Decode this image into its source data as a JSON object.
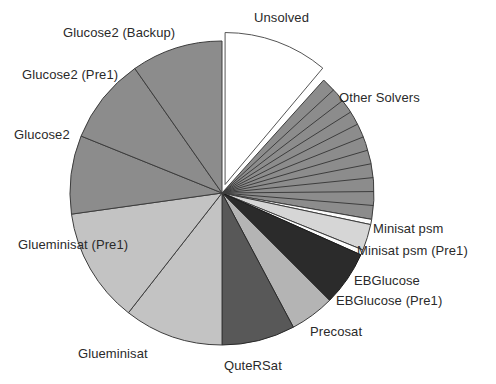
{
  "chart_data": {
    "type": "pie",
    "title": "",
    "subtitle": "",
    "xlabel": "",
    "ylabel": "",
    "legend_position": "none",
    "grid": false,
    "labels_placement": "outside-callout",
    "start_angle_deg": 0,
    "direction": "clockwise",
    "units": "share of instances (degrees of 360)",
    "categories": [
      "Unsolved",
      "Other Solvers",
      "Minisat psm",
      "Minisat psm (Pre1)",
      "EBGlucose",
      "EBGlucose (Pre1)",
      "Precosat",
      "QuteRSat",
      "Glueminisat",
      "Glueminisat (Pre1)",
      "Glucose2",
      "Glucose2 (Pre1)",
      "Glucose2 (Backup)"
    ],
    "values": [
      11.1,
      16.1,
      0.6,
      2.8,
      0.6,
      5.8,
      4.7,
      7.8,
      10.6,
      12.2,
      8.3,
      9.2,
      10.2
    ],
    "angles_deg": [
      40,
      58,
      2,
      10,
      2,
      21,
      17,
      28,
      38,
      44,
      30,
      33,
      37
    ],
    "slices": [
      {
        "label": "Unsolved",
        "start": 0,
        "end": 40,
        "color": "#ffffff",
        "stroke": "#555555",
        "exploded": true,
        "explode_px": 9
      },
      {
        "label": "Other Solvers",
        "start": 42,
        "end": 100,
        "color": "#8c8c8c",
        "stroke": "#3d3d3d",
        "exploded": false,
        "subdivisions": 11
      },
      {
        "label": "Minisat psm",
        "start": 100,
        "end": 102,
        "color": "#fbfbfb",
        "stroke": "#3d3d3d",
        "exploded": false
      },
      {
        "label": "Minisat psm (Pre1)",
        "start": 102,
        "end": 112,
        "color": "#d6d6d6",
        "stroke": "#3d3d3d",
        "exploded": false
      },
      {
        "label": "EBGlucose",
        "start": 112,
        "end": 114,
        "color": "#fbfbfb",
        "stroke": "#3d3d3d",
        "exploded": false
      },
      {
        "label": "EBGlucose (Pre1)",
        "start": 114,
        "end": 135,
        "color": "#2b2b2b",
        "stroke": "#1a1a1a",
        "exploded": false
      },
      {
        "label": "Precosat",
        "start": 135,
        "end": 152,
        "color": "#b4b4b4",
        "stroke": "#3d3d3d",
        "exploded": false
      },
      {
        "label": "QuteRSat",
        "start": 152,
        "end": 180,
        "color": "#585858",
        "stroke": "#2a2a2a",
        "exploded": false
      },
      {
        "label": "Glueminisat",
        "start": 180,
        "end": 218,
        "color": "#c3c3c3",
        "stroke": "#3d3d3d",
        "exploded": false
      },
      {
        "label": "Glueminisat (Pre1)",
        "start": 218,
        "end": 262,
        "color": "#c3c3c3",
        "stroke": "#3d3d3d",
        "exploded": false
      },
      {
        "label": "Glucose2",
        "start": 262,
        "end": 292,
        "color": "#8c8c8c",
        "stroke": "#3d3d3d",
        "exploded": false
      },
      {
        "label": "Glucose2 (Pre1)",
        "start": 292,
        "end": 325,
        "color": "#8c8c8c",
        "stroke": "#3d3d3d",
        "exploded": false
      },
      {
        "label": "Glucose2 (Backup)",
        "start": 325,
        "end": 360,
        "color": "#8c8c8c",
        "stroke": "#3d3d3d",
        "exploded": false
      }
    ]
  },
  "geometry": {
    "cx": 222,
    "cy": 193,
    "r": 152
  },
  "labels": [
    {
      "key": "unsolved",
      "text": "Unsolved",
      "x": 254,
      "y": 11,
      "align": "left"
    },
    {
      "key": "other_solvers",
      "text": "Other Solvers",
      "x": 339,
      "y": 91,
      "align": "left"
    },
    {
      "key": "minisat_psm",
      "text": "Minisat psm",
      "x": 373,
      "y": 222,
      "align": "left"
    },
    {
      "key": "minisat_psm_pre1",
      "text": "Minisat psm (Pre1)",
      "x": 357,
      "y": 244,
      "align": "left"
    },
    {
      "key": "ebglucose",
      "text": "EBGlucose",
      "x": 354,
      "y": 274,
      "align": "left"
    },
    {
      "key": "ebglucose_pre1",
      "text": "EBGlucose (Pre1)",
      "x": 336,
      "y": 294,
      "align": "left"
    },
    {
      "key": "precosat",
      "text": "Precosat",
      "x": 310,
      "y": 325,
      "align": "left"
    },
    {
      "key": "quters at",
      "text": "QuteRSat",
      "x": 224,
      "y": 359,
      "align": "left"
    },
    {
      "key": "glueminisat",
      "text": "Glueminisat",
      "x": 78,
      "y": 347,
      "align": "left"
    },
    {
      "key": "glueminisat_pre1",
      "text": "Glueminisat (Pre1)",
      "x": 18,
      "y": 238,
      "align": "left"
    },
    {
      "key": "glucose2",
      "text": "Glucose2",
      "x": 14,
      "y": 128,
      "align": "left"
    },
    {
      "key": "glucose2_pre1",
      "text": "Glucose2 (Pre1)",
      "x": 22,
      "y": 68,
      "align": "left"
    },
    {
      "key": "glucose2_backup",
      "text": "Glucose2 (Backup)",
      "x": 63,
      "y": 26,
      "align": "left"
    }
  ]
}
